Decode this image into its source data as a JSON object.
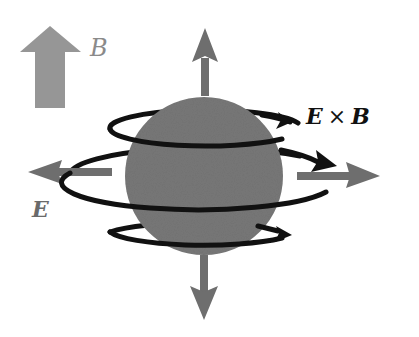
{
  "diagram": {
    "labels": {
      "b_field": "B",
      "e_field": "E",
      "drift_left": "E",
      "drift_op": "×",
      "drift_right": "B"
    },
    "colors": {
      "sphere": "#777777",
      "field_arrow": "#6e6e6e",
      "legend_arrow": "#969696",
      "orbit": "#111111",
      "background": "#ffffff"
    },
    "elements": [
      {
        "name": "legend-b-arrow",
        "direction": "up"
      },
      {
        "name": "sphere",
        "cx": 204,
        "cy": 176,
        "r": 78
      },
      {
        "name": "field-arrow-up",
        "direction": "up"
      },
      {
        "name": "field-arrow-down",
        "direction": "down"
      },
      {
        "name": "field-arrow-left",
        "direction": "left"
      },
      {
        "name": "field-arrow-right",
        "direction": "right"
      },
      {
        "name": "orbit-top",
        "direction": "counterclockwise-viewed-top"
      },
      {
        "name": "orbit-middle",
        "direction": "counterclockwise-viewed-top"
      },
      {
        "name": "orbit-bottom",
        "direction": "counterclockwise-viewed-top"
      }
    ]
  }
}
